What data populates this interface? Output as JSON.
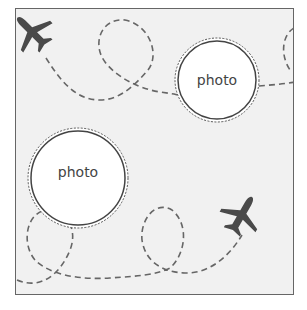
{
  "card": {
    "theme": "travel",
    "colors": {
      "background": "#f1f1f1",
      "frame_border": "#666666",
      "dash_path": "#666666",
      "plane": "#4a4a4a",
      "photo_fill": "#ffffff",
      "photo_border": "#444444",
      "text": "#444444"
    },
    "photos": [
      {
        "label": "photo",
        "cx": 217,
        "cy": 80,
        "r": 41
      },
      {
        "label": "photo",
        "cx": 78,
        "cy": 178,
        "r": 49
      }
    ],
    "icons": [
      {
        "name": "airplane-icon",
        "position": "top-left"
      },
      {
        "name": "airplane-icon",
        "position": "bottom-right"
      }
    ]
  }
}
